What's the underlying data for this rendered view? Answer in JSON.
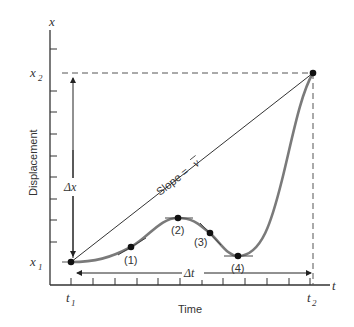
{
  "diagram": {
    "title": "",
    "y_axis": {
      "symbol": "x",
      "label": "Displacement",
      "ticks": [
        "x2",
        "x1"
      ]
    },
    "x_axis": {
      "symbol": "t",
      "label": "Time",
      "ticks": [
        "t1",
        "t2"
      ]
    },
    "labels": {
      "x1_main": "x",
      "x1_sub": "1",
      "x2_main": "x",
      "x2_sub": "2",
      "t1_main": "t",
      "t1_sub": "1",
      "t2_main": "t",
      "t2_sub": "2",
      "delta_x": "Δx",
      "delta_t": "Δt",
      "slope": "Slope = v̄",
      "slope_text": "Slope = ",
      "slope_v": "v",
      "y_axis_symbol": "x",
      "x_axis_symbol": "t",
      "y_axis_title": "Displacement",
      "x_axis_title": "Time"
    },
    "points": [
      {
        "id": "1",
        "label": "(1)"
      },
      {
        "id": "2",
        "label": "(2)"
      },
      {
        "id": "3",
        "label": "(3)"
      },
      {
        "id": "4",
        "label": "(4)"
      }
    ],
    "colors": {
      "axis": "#333333",
      "curve": "#7a7a7a",
      "points": "#111111",
      "dashed": "#555555"
    }
  }
}
